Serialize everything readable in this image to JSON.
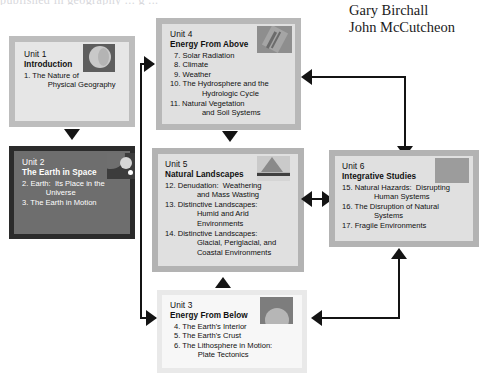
{
  "page": {
    "top_sliver_text": "published in geography ... g ...",
    "background_color": "#ffffff"
  },
  "authors": [
    {
      "name": "Gary Birchall"
    },
    {
      "name": "John McCutcheon"
    }
  ],
  "colors": {
    "box_border_light": "#bdbdbd",
    "box_border_dark": "#2b2b2b",
    "box_fill_light": "#e2e2e2",
    "box_fill_white": "#f4f4f4",
    "box_fill_dark": "#5d5d5d",
    "arrow": "#141414",
    "text_dark": "#101010",
    "text_light": "#ffffff"
  },
  "units": [
    {
      "id": "unit-1",
      "number": "Unit 1",
      "title": "Introduction",
      "chapters": [
        "1. The Nature of\n      Physical Geography"
      ],
      "thumbnail": "globe-sphere-thumbnail",
      "style": "light"
    },
    {
      "id": "unit-2",
      "number": "Unit 2",
      "title": "The Earth in Space",
      "chapters": [
        "2. Earth:  Its Place in the\n      Universe",
        "3. The Earth in Motion"
      ],
      "thumbnail": "planets-space-thumbnail",
      "style": "dark"
    },
    {
      "id": "unit-3",
      "number": "Unit 3",
      "title": "Energy From Below",
      "chapters": [
        "4. The Earth's Interior",
        "5. The Earth's Crust",
        "6. The Lithosphere in Motion:\n      Plate Tectonics"
      ],
      "thumbnail": "volcano-interior-thumbnail",
      "style": "white"
    },
    {
      "id": "unit-4",
      "number": "Unit 4",
      "title": "Energy From Above",
      "chapters": [
        "7. Solar Radiation",
        "8. Climate",
        "9. Weather",
        "10. The Hydrosphere and the\n        Hydrologic Cycle",
        "11. Natural Vegetation\n        and Soil Systems"
      ],
      "thumbnail": "sun-rays-thumbnail",
      "style": "light"
    },
    {
      "id": "unit-5",
      "number": "Unit 5",
      "title": "Natural Landscapes",
      "chapters": [
        "12. Denudation:  Weathering\n        and Mass Wasting",
        "13. Distinctive Landscapes:\n        Humid and Arid\n        Environments",
        "14. Distinctive Landscapes:\n        Glacial, Periglacial, and\n        Coastal Environments"
      ],
      "thumbnail": "mountain-landscape-thumbnail",
      "style": "light"
    },
    {
      "id": "unit-6",
      "number": "Unit 6",
      "title": "Integrative Studies",
      "chapters": [
        "15. Natural Hazards:  Disrupting\n        Human Systems",
        "16. The Disruption of Natural\n        Systems",
        "17. Fragile Environments"
      ],
      "thumbnail": "grey-field-thumbnail",
      "style": "light"
    }
  ],
  "connectors": [
    {
      "id": "unit1-to-unit2",
      "kind": "arrow-down"
    },
    {
      "id": "unit2-to-unit4",
      "kind": "elbow-arrow-right"
    },
    {
      "id": "unit2-to-unit3",
      "kind": "elbow-arrow-right"
    },
    {
      "id": "unit4-to-unit5",
      "kind": "arrow-down"
    },
    {
      "id": "unit4-to-unit6",
      "kind": "elbow-arrow"
    },
    {
      "id": "unit5-to-unit6",
      "kind": "double-arrow"
    },
    {
      "id": "unit3-to-unit5",
      "kind": "arrow-up"
    },
    {
      "id": "unit3-to-unit6",
      "kind": "elbow-arrow-up"
    }
  ]
}
